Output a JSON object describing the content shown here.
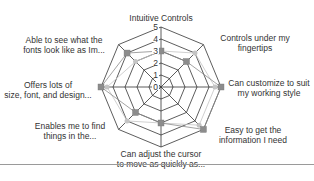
{
  "chart_data": {
    "type": "radar",
    "title": "",
    "axes": [
      "Intuitive Controls",
      "Controls under my fingertips",
      "Can customize to suit my working style",
      "Easy to get the information I need",
      "Can adjust the cursor to move as quickly as...",
      "Enables me to find things in the...",
      "Offers lots of size, font, and design...",
      "Able to see what the fonts look like as Im..."
    ],
    "scale": {
      "min": 0,
      "max": 5,
      "ticks": [
        "0",
        "1",
        "2",
        "3",
        "4",
        "5"
      ]
    },
    "series": [
      {
        "name": "Series 1",
        "marker": "square",
        "color": "#8c8c8c",
        "values": [
          3,
          3,
          5,
          5,
          3,
          3,
          5,
          4
        ]
      },
      {
        "name": "Series 2",
        "marker": "circle",
        "color": "#c4c4c4",
        "values": [
          3,
          4,
          4.5,
          4.5,
          3,
          4,
          4.5,
          3
        ]
      }
    ],
    "grid": true,
    "legend": "none"
  },
  "labels": {
    "axis0": "Intuitive Controls",
    "axis1_l1": "Controls under my",
    "axis1_l2": "fingertips",
    "axis2_l1": "Can customize to suit",
    "axis2_l2": "my working style",
    "axis3_l1": "Easy to get the",
    "axis3_l2": "information I need",
    "axis4_l1": "Can adjust the cursor",
    "axis4_l2": "to move as quickly as...",
    "axis5_l1": "Enables me to find",
    "axis5_l2": "things in the...",
    "axis6_l1": "Offers lots of",
    "axis6_l2": "size, font, and design...",
    "axis7_l1": "Able to see what the",
    "axis7_l2": "fonts look like as Im..."
  }
}
